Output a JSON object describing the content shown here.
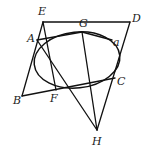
{
  "figure": {
    "type": "geometry-diagram",
    "ellipse": {
      "cx": 77,
      "cy": 60,
      "rx": 43,
      "ry": 28,
      "rotation": -6,
      "label": "a"
    },
    "points": {
      "A": {
        "x": 37,
        "y": 40,
        "label": "A"
      },
      "B": {
        "x": 22,
        "y": 96,
        "label": "B"
      },
      "C": {
        "x": 115,
        "y": 78,
        "label": "C"
      },
      "D": {
        "x": 130,
        "y": 22,
        "label": "D"
      },
      "E": {
        "x": 43,
        "y": 22,
        "label": "E"
      },
      "F": {
        "x": 56,
        "y": 90,
        "label": "F"
      },
      "G": {
        "x": 82,
        "y": 32,
        "label": "G"
      },
      "H": {
        "x": 97,
        "y": 130,
        "label": "H"
      }
    },
    "labels": {
      "A": "A",
      "B": "B",
      "C": "C",
      "D": "D",
      "E": "E",
      "F": "F",
      "G": "G",
      "H": "H",
      "a": "a"
    },
    "segments": [
      [
        "E",
        "D"
      ],
      [
        "E",
        "B"
      ],
      [
        "B",
        "C"
      ],
      [
        "D",
        "H"
      ],
      [
        "E",
        "F"
      ],
      [
        "G",
        "H"
      ],
      [
        "A",
        "H"
      ],
      [
        "A",
        "C"
      ]
    ],
    "colors": {
      "stroke": "#111111",
      "background": "#ffffff"
    }
  }
}
